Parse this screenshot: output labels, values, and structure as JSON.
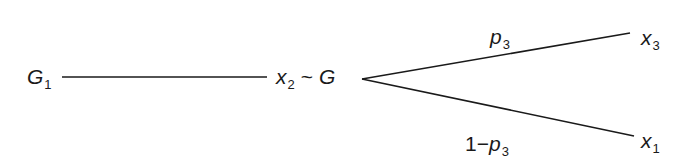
{
  "diagram": {
    "type": "probability-tree",
    "nodes": {
      "start": {
        "base": "G",
        "sub": "1"
      },
      "middle": {
        "base": "x",
        "sub": "2",
        "relation": "~",
        "dist": "G"
      },
      "upper_outcome": {
        "base": "x",
        "sub": "3"
      },
      "lower_outcome": {
        "base": "x",
        "sub": "1"
      }
    },
    "edges": {
      "upper": {
        "prefix": "",
        "base": "p",
        "sub": "3"
      },
      "lower": {
        "prefix": "1",
        "op": "−",
        "base": "p",
        "sub": "3"
      }
    },
    "colors": {
      "line": "#1a1a1a",
      "text": "#1a1a1a",
      "background": "#ffffff"
    }
  }
}
